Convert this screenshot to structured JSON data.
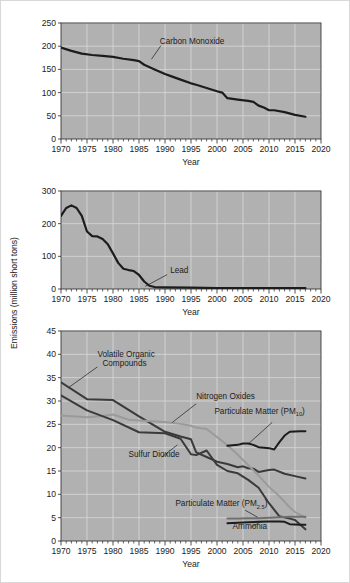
{
  "figure": {
    "y_axis_title": "Emissions (million short tons)",
    "background_color": "#ffffff",
    "plot_background_color": "#b3b3b3",
    "grid_color": "#d9d9d9",
    "frame_color": "#3a3a3a"
  },
  "chart_data": [
    {
      "type": "line",
      "id": "chart-carbon-monoxide",
      "title": "",
      "xlabel": "Year",
      "ylabel": "Emissions (million short tons)",
      "xlim": [
        1970,
        2020
      ],
      "ylim": [
        0,
        250
      ],
      "xticks": [
        1970,
        1975,
        1980,
        1985,
        1990,
        1995,
        2000,
        2005,
        2010,
        2015,
        2020
      ],
      "yticks": [
        0,
        50,
        100,
        150,
        200,
        250
      ],
      "grid": true,
      "legend_position": "inline-annotation",
      "series": [
        {
          "name": "Carbon Monoxide",
          "color": "#1c1c1c",
          "width": 2.2,
          "label_x": 1989,
          "label_y": 205,
          "x": [
            1970,
            1972,
            1974,
            1976,
            1978,
            1980,
            1982,
            1984,
            1985,
            1986,
            1988,
            1990,
            1991,
            1993,
            1995,
            1996,
            1998,
            2000,
            2001,
            2002,
            2004,
            2006,
            2007,
            2008,
            2009,
            2010,
            2011,
            2013,
            2015,
            2017
          ],
          "values": [
            197,
            190,
            184,
            181,
            179,
            177,
            173,
            170,
            168,
            160,
            150,
            140,
            136,
            128,
            120,
            117,
            110,
            103,
            100,
            88,
            85,
            82,
            80,
            72,
            68,
            62,
            62,
            58,
            52,
            48
          ]
        }
      ]
    },
    {
      "type": "line",
      "id": "chart-lead",
      "title": "",
      "xlabel": "Year",
      "ylabel": "Emissions (million short tons)",
      "xlim": [
        1970,
        2020
      ],
      "ylim": [
        0,
        300
      ],
      "xticks": [
        1970,
        1975,
        1980,
        1985,
        1990,
        1995,
        2000,
        2005,
        2010,
        2015,
        2020
      ],
      "yticks": [
        0,
        100,
        200,
        300
      ],
      "grid": true,
      "legend_position": "inline-annotation",
      "series": [
        {
          "name": "Lead",
          "color": "#1c1c1c",
          "width": 2.2,
          "label_x": 1991,
          "label_y": 48,
          "x": [
            1970,
            1971,
            1972,
            1973,
            1974,
            1975,
            1976,
            1977,
            1978,
            1979,
            1980,
            1981,
            1982,
            1983,
            1984,
            1985,
            1986,
            1987,
            1988,
            1990,
            1995,
            2000,
            2005,
            2010,
            2014,
            2017
          ],
          "values": [
            224,
            248,
            256,
            248,
            224,
            176,
            162,
            161,
            153,
            137,
            109,
            80,
            62,
            58,
            55,
            43,
            23,
            10,
            6,
            5,
            4,
            3,
            3,
            3,
            3,
            3
          ]
        }
      ]
    },
    {
      "type": "line",
      "id": "chart-multi-pollutant",
      "title": "",
      "xlabel": "Year",
      "ylabel": "Emissions (million short tons)",
      "xlim": [
        1970,
        2020
      ],
      "ylim": [
        0,
        45
      ],
      "xticks": [
        1970,
        1975,
        1980,
        1985,
        1990,
        1995,
        2000,
        2005,
        2010,
        2015,
        2020
      ],
      "yticks": [
        0,
        5,
        10,
        15,
        20,
        25,
        30,
        35,
        40,
        45
      ],
      "grid": true,
      "legend_position": "inline-annotation",
      "series": [
        {
          "name": "Volatile Organic Compounds",
          "color": "#3a3a3a",
          "width": 2.0,
          "label_x": 1977,
          "label_y": 39.5,
          "x": [
            1970,
            1975,
            1980,
            1985,
            1990,
            1993,
            1995,
            1996,
            1998,
            2000,
            2002,
            2004,
            2005,
            2006,
            2007,
            2008,
            2010,
            2011,
            2013,
            2015,
            2017
          ],
          "values": [
            34.0,
            30.4,
            30.2,
            26.7,
            23.4,
            22.4,
            21.8,
            19.0,
            18.0,
            17.0,
            16.5,
            15.8,
            16.0,
            15.6,
            15.5,
            14.8,
            15.2,
            15.3,
            14.4,
            13.9,
            13.4
          ]
        },
        {
          "name": "Nitrogen Oxides",
          "color": "#9a9a9a",
          "width": 2.0,
          "label_x": 1996,
          "label_y": 30.5,
          "x": [
            1970,
            1975,
            1978,
            1980,
            1983,
            1985,
            1990,
            1993,
            1995,
            1996,
            1998,
            2000,
            2002,
            2004,
            2006,
            2008,
            2010,
            2012,
            2014,
            2015,
            2017
          ],
          "values": [
            26.9,
            26.5,
            26.8,
            27.1,
            26.0,
            25.8,
            25.5,
            25.1,
            24.7,
            24.3,
            24.0,
            22.3,
            20.5,
            18.5,
            16.3,
            14.0,
            11.6,
            9.6,
            7.2,
            6.2,
            5.0
          ]
        },
        {
          "name": "Particulate Matter (PM10)",
          "label_main": "Particulate Matter (PM",
          "label_sub": "10",
          "label_close": ")",
          "color": "#1c1c1c",
          "width": 2.0,
          "label_x": 1999.5,
          "label_y": 27.2,
          "x": [
            2002,
            2004,
            2005,
            2006,
            2007,
            2008,
            2010,
            2011,
            2012,
            2013,
            2014,
            2016,
            2017
          ],
          "values": [
            20.4,
            20.6,
            20.9,
            20.9,
            20.6,
            20.1,
            19.9,
            19.6,
            21.2,
            22.6,
            23.4,
            23.5,
            23.5
          ]
        },
        {
          "name": "Sulfur Dioxide",
          "color": "#3a3a3a",
          "width": 2.0,
          "label_x": 1983,
          "label_y": 18.0,
          "x": [
            1970,
            1975,
            1980,
            1985,
            1990,
            1993,
            1995,
            1996,
            1998,
            2000,
            2002,
            2004,
            2006,
            2008,
            2010,
            2012,
            2014,
            2015,
            2017
          ],
          "values": [
            31.2,
            28.0,
            25.9,
            23.3,
            23.1,
            21.9,
            18.6,
            18.4,
            19.4,
            16.3,
            15.0,
            14.5,
            13.1,
            11.4,
            8.1,
            5.3,
            4.8,
            4.5,
            2.5
          ]
        },
        {
          "name": "Particulate Matter (PM2.5)",
          "label_main": "Particulate Matter (PM",
          "label_sub": "2.5",
          "label_close": ")",
          "color": "#6f6f6f",
          "width": 2.0,
          "label_x": 1992,
          "label_y": 7.4,
          "x": [
            2002,
            2004,
            2006,
            2008,
            2010,
            2012,
            2014,
            2016,
            2017
          ],
          "values": [
            4.8,
            4.8,
            4.9,
            4.9,
            5.0,
            5.1,
            5.2,
            5.2,
            5.2
          ]
        },
        {
          "name": "Ammonia",
          "color": "#1c1c1c",
          "width": 2.0,
          "label_x": 2003,
          "label_y": 2.6,
          "x": [
            2002,
            2004,
            2006,
            2008,
            2010,
            2012,
            2013,
            2014,
            2016,
            2017
          ],
          "values": [
            3.8,
            3.9,
            4.0,
            4.1,
            4.2,
            4.2,
            4.1,
            3.6,
            3.5,
            3.5
          ]
        }
      ]
    }
  ]
}
